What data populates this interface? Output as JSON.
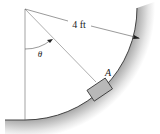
{
  "diagram": {
    "dimension_label": "4 ft",
    "angle_label": "θ",
    "block_label": "A",
    "colors": {
      "line": "#444444",
      "block_fill": "#b8b8b8",
      "surface_shadow": "#cfcfcf",
      "background": "#ffffff"
    }
  }
}
